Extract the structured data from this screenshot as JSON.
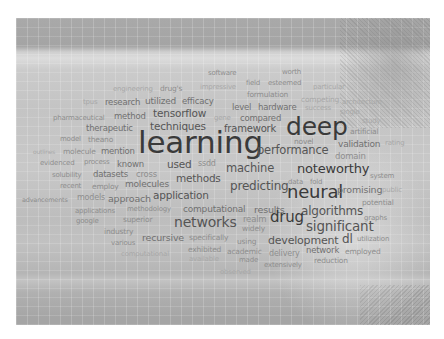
{
  "word_cloud": {
    "words": [
      {
        "text": "software",
        "x": 208,
        "y": 70,
        "size": 7,
        "tone": "c4"
      },
      {
        "text": "worth",
        "x": 282,
        "y": 69,
        "size": 7,
        "tone": "c4"
      },
      {
        "text": "engineering",
        "x": 113,
        "y": 86,
        "size": 7,
        "tone": "c5"
      },
      {
        "text": "drug's",
        "x": 160,
        "y": 85,
        "size": 7.5,
        "tone": "c4"
      },
      {
        "text": "impressive",
        "x": 200,
        "y": 84,
        "size": 7,
        "tone": "c5"
      },
      {
        "text": "field",
        "x": 246,
        "y": 80,
        "size": 7,
        "tone": "c4"
      },
      {
        "text": "esteemed",
        "x": 268,
        "y": 80,
        "size": 7,
        "tone": "c4"
      },
      {
        "text": "particular",
        "x": 313,
        "y": 84,
        "size": 7,
        "tone": "c5"
      },
      {
        "text": "formulation",
        "x": 247,
        "y": 91,
        "size": 7.5,
        "tone": "c4"
      },
      {
        "text": "competing",
        "x": 301,
        "y": 96,
        "size": 7.5,
        "tone": "c5"
      },
      {
        "text": "architecture",
        "x": 342,
        "y": 99,
        "size": 7,
        "tone": "c5"
      },
      {
        "text": "tpus",
        "x": 83,
        "y": 99,
        "size": 7,
        "tone": "c5"
      },
      {
        "text": "research",
        "x": 105,
        "y": 98,
        "size": 8.5,
        "tone": "c3"
      },
      {
        "text": "utilized",
        "x": 145,
        "y": 97,
        "size": 9,
        "tone": "c3"
      },
      {
        "text": "efficacy",
        "x": 182,
        "y": 97,
        "size": 8.5,
        "tone": "c3"
      },
      {
        "text": "level",
        "x": 232,
        "y": 103,
        "size": 8.5,
        "tone": "c3"
      },
      {
        "text": "hardware",
        "x": 258,
        "y": 103,
        "size": 8.5,
        "tone": "c3"
      },
      {
        "text": "success",
        "x": 305,
        "y": 105,
        "size": 7,
        "tone": "c5"
      },
      {
        "text": "single",
        "x": 340,
        "y": 109,
        "size": 7,
        "tone": "c5"
      },
      {
        "text": "pharmaceutical",
        "x": 53,
        "y": 115,
        "size": 7,
        "tone": "c4"
      },
      {
        "text": "method",
        "x": 114,
        "y": 112,
        "size": 8.5,
        "tone": "c3"
      },
      {
        "text": "tensorflow",
        "x": 153,
        "y": 108,
        "size": 10.5,
        "tone": "c2"
      },
      {
        "text": "gene",
        "x": 214,
        "y": 115,
        "size": 7,
        "tone": "c5"
      },
      {
        "text": "compared",
        "x": 240,
        "y": 114,
        "size": 8.5,
        "tone": "c3"
      },
      {
        "text": "study",
        "x": 362,
        "y": 118,
        "size": 7,
        "tone": "c5"
      },
      {
        "text": "therapeutic",
        "x": 86,
        "y": 124,
        "size": 8.5,
        "tone": "c3"
      },
      {
        "text": "techniques",
        "x": 150,
        "y": 121,
        "size": 10.5,
        "tone": "c2"
      },
      {
        "text": "framework",
        "x": 224,
        "y": 124,
        "size": 10,
        "tone": "c2"
      },
      {
        "text": "deep",
        "x": 286,
        "y": 114,
        "size": 25,
        "tone": "c1"
      },
      {
        "text": "artificial",
        "x": 350,
        "y": 128,
        "size": 7.5,
        "tone": "c4"
      },
      {
        "text": "model",
        "x": 60,
        "y": 136,
        "size": 7,
        "tone": "c4"
      },
      {
        "text": "theano",
        "x": 88,
        "y": 136,
        "size": 7.5,
        "tone": "c4"
      },
      {
        "text": "learning",
        "x": 138,
        "y": 127,
        "size": 31,
        "tone": "c1"
      },
      {
        "text": "novel",
        "x": 294,
        "y": 138,
        "size": 7.5,
        "tone": "c4"
      },
      {
        "text": "validation",
        "x": 338,
        "y": 140,
        "size": 9,
        "tone": "c3"
      },
      {
        "text": "rating",
        "x": 385,
        "y": 140,
        "size": 7,
        "tone": "c5"
      },
      {
        "text": "outlines",
        "x": 33,
        "y": 149,
        "size": 6,
        "tone": "c5"
      },
      {
        "text": "molecule",
        "x": 63,
        "y": 148,
        "size": 7.5,
        "tone": "c4"
      },
      {
        "text": "mention",
        "x": 101,
        "y": 147,
        "size": 8.5,
        "tone": "c3"
      },
      {
        "text": "performance",
        "x": 257,
        "y": 145,
        "size": 11.5,
        "tone": "c2"
      },
      {
        "text": "domain",
        "x": 335,
        "y": 152,
        "size": 8.5,
        "tone": "c4"
      },
      {
        "text": "evidenced",
        "x": 40,
        "y": 160,
        "size": 7,
        "tone": "c4"
      },
      {
        "text": "process",
        "x": 84,
        "y": 159,
        "size": 7,
        "tone": "c4"
      },
      {
        "text": "known",
        "x": 117,
        "y": 160,
        "size": 8.5,
        "tone": "c3"
      },
      {
        "text": "used",
        "x": 167,
        "y": 159,
        "size": 10.5,
        "tone": "c2"
      },
      {
        "text": "ssdd",
        "x": 198,
        "y": 160,
        "size": 8,
        "tone": "c4"
      },
      {
        "text": "machine",
        "x": 226,
        "y": 163,
        "size": 11.5,
        "tone": "c2"
      },
      {
        "text": "noteworthy",
        "x": 297,
        "y": 162,
        "size": 13,
        "tone": "c1"
      },
      {
        "text": "system",
        "x": 370,
        "y": 173,
        "size": 7,
        "tone": "c4"
      },
      {
        "text": "solubility",
        "x": 52,
        "y": 172,
        "size": 7,
        "tone": "c4"
      },
      {
        "text": "datasets",
        "x": 93,
        "y": 170,
        "size": 8.5,
        "tone": "c3"
      },
      {
        "text": "cross",
        "x": 136,
        "y": 170,
        "size": 8.5,
        "tone": "c4"
      },
      {
        "text": "methods",
        "x": 176,
        "y": 173,
        "size": 10.5,
        "tone": "c2"
      },
      {
        "text": "predicting",
        "x": 230,
        "y": 180,
        "size": 12,
        "tone": "c2"
      },
      {
        "text": "data",
        "x": 288,
        "y": 179,
        "size": 7,
        "tone": "c4"
      },
      {
        "text": "fold",
        "x": 310,
        "y": 179,
        "size": 7,
        "tone": "c4"
      },
      {
        "text": "neural",
        "x": 287,
        "y": 183,
        "size": 18,
        "tone": "c1"
      },
      {
        "text": "promising",
        "x": 337,
        "y": 185,
        "size": 9.5,
        "tone": "c3"
      },
      {
        "text": "public",
        "x": 382,
        "y": 187,
        "size": 7,
        "tone": "c5"
      },
      {
        "text": "recent",
        "x": 60,
        "y": 183,
        "size": 7,
        "tone": "c4"
      },
      {
        "text": "employ",
        "x": 92,
        "y": 183,
        "size": 7.5,
        "tone": "c4"
      },
      {
        "text": "molecules",
        "x": 125,
        "y": 180,
        "size": 9,
        "tone": "c3"
      },
      {
        "text": "application",
        "x": 153,
        "y": 190,
        "size": 10.5,
        "tone": "c2"
      },
      {
        "text": "advancements",
        "x": 22,
        "y": 197,
        "size": 6.5,
        "tone": "c4"
      },
      {
        "text": "models",
        "x": 77,
        "y": 194,
        "size": 8,
        "tone": "c4"
      },
      {
        "text": "approach",
        "x": 108,
        "y": 194,
        "size": 9.5,
        "tone": "c3"
      },
      {
        "text": "computational",
        "x": 183,
        "y": 205,
        "size": 9,
        "tone": "c3"
      },
      {
        "text": "results",
        "x": 254,
        "y": 205,
        "size": 9.5,
        "tone": "c3"
      },
      {
        "text": "potential",
        "x": 362,
        "y": 199,
        "size": 7.5,
        "tone": "c4"
      },
      {
        "text": "applications",
        "x": 75,
        "y": 208,
        "size": 7,
        "tone": "c4"
      },
      {
        "text": "methodology",
        "x": 127,
        "y": 206,
        "size": 7,
        "tone": "c4"
      },
      {
        "text": "algorithms",
        "x": 301,
        "y": 205,
        "size": 12,
        "tone": "c2"
      },
      {
        "text": "google",
        "x": 76,
        "y": 218,
        "size": 7,
        "tone": "c4"
      },
      {
        "text": "superior",
        "x": 123,
        "y": 216,
        "size": 7.5,
        "tone": "c4"
      },
      {
        "text": "networks",
        "x": 174,
        "y": 215,
        "size": 14,
        "tone": "c2"
      },
      {
        "text": "realm",
        "x": 243,
        "y": 215,
        "size": 8.5,
        "tone": "c4"
      },
      {
        "text": "drug",
        "x": 270,
        "y": 210,
        "size": 15,
        "tone": "c1"
      },
      {
        "text": "significant",
        "x": 306,
        "y": 220,
        "size": 13.5,
        "tone": "c2"
      },
      {
        "text": "graphs",
        "x": 364,
        "y": 215,
        "size": 7,
        "tone": "c4"
      },
      {
        "text": "industry",
        "x": 104,
        "y": 228,
        "size": 7.5,
        "tone": "c4"
      },
      {
        "text": "widely",
        "x": 242,
        "y": 225,
        "size": 7.5,
        "tone": "c4"
      },
      {
        "text": "various",
        "x": 111,
        "y": 240,
        "size": 7,
        "tone": "c4"
      },
      {
        "text": "recursive",
        "x": 142,
        "y": 233,
        "size": 9.5,
        "tone": "c3"
      },
      {
        "text": "specifically",
        "x": 189,
        "y": 234,
        "size": 7.5,
        "tone": "c4"
      },
      {
        "text": "using",
        "x": 237,
        "y": 238,
        "size": 7.5,
        "tone": "c4"
      },
      {
        "text": "development",
        "x": 268,
        "y": 235,
        "size": 11,
        "tone": "c2"
      },
      {
        "text": "dl",
        "x": 342,
        "y": 233,
        "size": 12,
        "tone": "c2"
      },
      {
        "text": "utilization",
        "x": 357,
        "y": 236,
        "size": 7,
        "tone": "c4"
      },
      {
        "text": "computational",
        "x": 121,
        "y": 251,
        "size": 7,
        "tone": "c5"
      },
      {
        "text": "exhibited",
        "x": 188,
        "y": 246,
        "size": 7.5,
        "tone": "c4"
      },
      {
        "text": "academic",
        "x": 227,
        "y": 248,
        "size": 7.5,
        "tone": "c4"
      },
      {
        "text": "delivery",
        "x": 269,
        "y": 250,
        "size": 8,
        "tone": "c4"
      },
      {
        "text": "network",
        "x": 306,
        "y": 246,
        "size": 8.5,
        "tone": "c3"
      },
      {
        "text": "employed",
        "x": 345,
        "y": 248,
        "size": 7.5,
        "tone": "c4"
      },
      {
        "text": "available",
        "x": 189,
        "y": 256,
        "size": 7,
        "tone": "c5"
      },
      {
        "text": "made",
        "x": 239,
        "y": 257,
        "size": 7,
        "tone": "c4"
      },
      {
        "text": "extensively",
        "x": 264,
        "y": 262,
        "size": 7,
        "tone": "c4"
      },
      {
        "text": "reduction",
        "x": 314,
        "y": 257,
        "size": 7.5,
        "tone": "c4"
      },
      {
        "text": "observed",
        "x": 220,
        "y": 269,
        "size": 7,
        "tone": "c5"
      }
    ]
  }
}
